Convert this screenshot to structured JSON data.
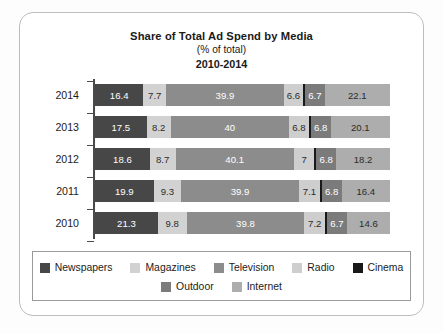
{
  "chart_data": {
    "type": "bar",
    "subtype": "stacked-horizontal-100pct",
    "title": "Share of Total Ad Spend by Media",
    "subtitle": "(% of total)",
    "period": "2010-2014",
    "xlabel": "",
    "ylabel": "",
    "grid": false,
    "legend_position": "bottom",
    "xlim": [
      0,
      100
    ],
    "categories": [
      "2014",
      "2013",
      "2012",
      "2011",
      "2010"
    ],
    "series": [
      {
        "name": "Newspapers",
        "color": "#474747",
        "values": [
          16.4,
          17.5,
          18.6,
          19.9,
          21.3
        ]
      },
      {
        "name": "Magazines",
        "color": "#d2d2d2",
        "values": [
          7.7,
          8.2,
          8.7,
          9.3,
          9.8
        ]
      },
      {
        "name": "Television",
        "color": "#8c8c8c",
        "values": [
          39.9,
          40,
          40.1,
          39.9,
          39.8
        ]
      },
      {
        "name": "Radio",
        "color": "#cecece",
        "values": [
          6.6,
          6.8,
          7,
          7.1,
          7.2
        ]
      },
      {
        "name": "Cinema",
        "color": "#191919",
        "values": [
          0.6,
          0.6,
          0.6,
          0.6,
          0.6
        ]
      },
      {
        "name": "Outdoor",
        "color": "#7b7b7b",
        "values": [
          6.7,
          6.8,
          6.8,
          6.8,
          6.7
        ]
      },
      {
        "name": "Internet",
        "color": "#adadad",
        "values": [
          22.1,
          20.1,
          18.2,
          16.4,
          14.6
        ]
      }
    ],
    "rows": [
      {
        "year": "2014",
        "segments": [
          {
            "media": "Newspapers",
            "label": "16.4",
            "value": 16.4,
            "color": "#474747",
            "text": "light"
          },
          {
            "media": "Magazines",
            "label": "7.7",
            "value": 7.7,
            "color": "#d2d2d2",
            "text": "dark"
          },
          {
            "media": "Television",
            "label": "39.9",
            "value": 39.9,
            "color": "#8c8c8c",
            "text": "light"
          },
          {
            "media": "Radio",
            "label": "6.6",
            "value": 6.6,
            "color": "#cecece",
            "text": "dark"
          },
          {
            "media": "Cinema",
            "label": "",
            "value": 0.6,
            "color": "#191919",
            "text": "light"
          },
          {
            "media": "Outdoor",
            "label": "6.7",
            "value": 6.7,
            "color": "#7b7b7b",
            "text": "light"
          },
          {
            "media": "Internet",
            "label": "22.1",
            "value": 22.1,
            "color": "#adadad",
            "text": "dark"
          }
        ]
      },
      {
        "year": "2013",
        "segments": [
          {
            "media": "Newspapers",
            "label": "17.5",
            "value": 17.5,
            "color": "#474747",
            "text": "light"
          },
          {
            "media": "Magazines",
            "label": "8.2",
            "value": 8.2,
            "color": "#d2d2d2",
            "text": "dark"
          },
          {
            "media": "Television",
            "label": "40",
            "value": 40,
            "color": "#8c8c8c",
            "text": "light"
          },
          {
            "media": "Radio",
            "label": "6.8",
            "value": 6.8,
            "color": "#cecece",
            "text": "dark"
          },
          {
            "media": "Cinema",
            "label": "",
            "value": 0.6,
            "color": "#191919",
            "text": "light"
          },
          {
            "media": "Outdoor",
            "label": "6.8",
            "value": 6.8,
            "color": "#7b7b7b",
            "text": "light"
          },
          {
            "media": "Internet",
            "label": "20.1",
            "value": 20.1,
            "color": "#adadad",
            "text": "dark"
          }
        ]
      },
      {
        "year": "2012",
        "segments": [
          {
            "media": "Newspapers",
            "label": "18.6",
            "value": 18.6,
            "color": "#474747",
            "text": "light"
          },
          {
            "media": "Magazines",
            "label": "8.7",
            "value": 8.7,
            "color": "#d2d2d2",
            "text": "dark"
          },
          {
            "media": "Television",
            "label": "40.1",
            "value": 40.1,
            "color": "#8c8c8c",
            "text": "light"
          },
          {
            "media": "Radio",
            "label": "7",
            "value": 7,
            "color": "#cecece",
            "text": "dark"
          },
          {
            "media": "Cinema",
            "label": "",
            "value": 0.6,
            "color": "#191919",
            "text": "light"
          },
          {
            "media": "Outdoor",
            "label": "6.8",
            "value": 6.8,
            "color": "#7b7b7b",
            "text": "light"
          },
          {
            "media": "Internet",
            "label": "18.2",
            "value": 18.2,
            "color": "#adadad",
            "text": "dark"
          }
        ]
      },
      {
        "year": "2011",
        "segments": [
          {
            "media": "Newspapers",
            "label": "19.9",
            "value": 19.9,
            "color": "#474747",
            "text": "light"
          },
          {
            "media": "Magazines",
            "label": "9.3",
            "value": 9.3,
            "color": "#d2d2d2",
            "text": "dark"
          },
          {
            "media": "Television",
            "label": "39.9",
            "value": 39.9,
            "color": "#8c8c8c",
            "text": "light"
          },
          {
            "media": "Radio",
            "label": "7.1",
            "value": 7.1,
            "color": "#cecece",
            "text": "dark"
          },
          {
            "media": "Cinema",
            "label": "",
            "value": 0.6,
            "color": "#191919",
            "text": "light"
          },
          {
            "media": "Outdoor",
            "label": "6.8",
            "value": 6.8,
            "color": "#7b7b7b",
            "text": "light"
          },
          {
            "media": "Internet",
            "label": "16.4",
            "value": 16.4,
            "color": "#adadad",
            "text": "dark"
          }
        ]
      },
      {
        "year": "2010",
        "segments": [
          {
            "media": "Newspapers",
            "label": "21.3",
            "value": 21.3,
            "color": "#474747",
            "text": "light"
          },
          {
            "media": "Magazines",
            "label": "9.8",
            "value": 9.8,
            "color": "#d2d2d2",
            "text": "dark"
          },
          {
            "media": "Television",
            "label": "39.8",
            "value": 39.8,
            "color": "#8c8c8c",
            "text": "light"
          },
          {
            "media": "Radio",
            "label": "7.2",
            "value": 7.2,
            "color": "#cecece",
            "text": "dark"
          },
          {
            "media": "Cinema",
            "label": "",
            "value": 0.6,
            "color": "#191919",
            "text": "light"
          },
          {
            "media": "Outdoor",
            "label": "6.7",
            "value": 6.7,
            "color": "#7b7b7b",
            "text": "light"
          },
          {
            "media": "Internet",
            "label": "14.6",
            "value": 14.6,
            "color": "#adadad",
            "text": "dark"
          }
        ]
      }
    ],
    "legend": {
      "rows": [
        [
          {
            "label": "Newspapers",
            "color": "#474747"
          },
          {
            "label": "Magazines",
            "color": "#d2d2d2"
          },
          {
            "label": "Television",
            "color": "#8c8c8c"
          },
          {
            "label": "Radio",
            "color": "#cecece"
          },
          {
            "label": "Cinema",
            "color": "#191919"
          }
        ],
        [
          {
            "label": "Outdoor",
            "color": "#7b7b7b"
          },
          {
            "label": "Internet",
            "color": "#adadad"
          }
        ]
      ]
    }
  }
}
